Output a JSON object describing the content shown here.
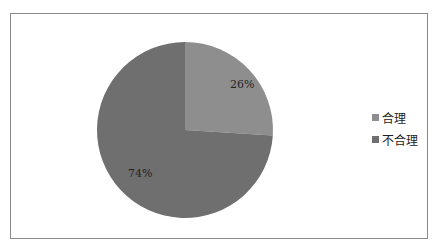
{
  "chart_data": {
    "type": "pie",
    "title": "",
    "categories": [
      "合理",
      "不合理"
    ],
    "values": [
      26,
      74
    ],
    "labels": [
      "26%",
      "74%"
    ],
    "colors": [
      "#8e8e8e",
      "#6f6f6f"
    ],
    "legend_position": "right",
    "start_angle": "12 o'clock, clockwise"
  },
  "legend": [
    {
      "label": "合理",
      "color": "#8e8e8e"
    },
    {
      "label": "不合理",
      "color": "#6f6f6f"
    }
  ]
}
